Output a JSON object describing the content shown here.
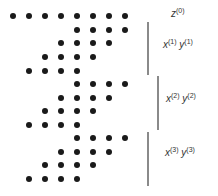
{
  "diagram": {
    "colors": {
      "dot": "#1a1a1a",
      "line": "#8a8a8a",
      "text": "#333333"
    },
    "grid": {
      "x0": 13,
      "dx": 16
    },
    "rows": [
      {
        "y": 16,
        "cols": [
          0,
          1,
          2,
          3,
          4,
          5,
          6,
          7
        ],
        "group": "z0"
      },
      {
        "y": 30,
        "cols": [
          4,
          5,
          6,
          7
        ],
        "group": "1"
      },
      {
        "y": 43,
        "cols": [
          3,
          4,
          5,
          6
        ],
        "group": "1"
      },
      {
        "y": 57,
        "cols": [
          2,
          3,
          4,
          5
        ],
        "group": "1"
      },
      {
        "y": 71,
        "cols": [
          1,
          2,
          3,
          4
        ],
        "group": "1"
      },
      {
        "y": 84,
        "cols": [
          4,
          5,
          6,
          7
        ],
        "group": "2"
      },
      {
        "y": 98,
        "cols": [
          3,
          4,
          5,
          6
        ],
        "group": "2"
      },
      {
        "y": 111,
        "cols": [
          2,
          3,
          4,
          5
        ],
        "group": "2"
      },
      {
        "y": 125,
        "cols": [
          1,
          2,
          3,
          4
        ],
        "group": "2"
      },
      {
        "y": 138,
        "cols": [
          4,
          5,
          6,
          7
        ],
        "group": "3"
      },
      {
        "y": 152,
        "cols": [
          3,
          4,
          5,
          6
        ],
        "group": "3"
      },
      {
        "y": 165,
        "cols": [
          2,
          3,
          4,
          5
        ],
        "group": "3"
      },
      {
        "y": 179,
        "cols": [
          1,
          2,
          3,
          4
        ],
        "group": "3"
      }
    ],
    "brackets": [
      {
        "x": 147,
        "y1": 22,
        "y2": 75
      },
      {
        "x": 157,
        "y1": 76,
        "y2": 130
      },
      {
        "x": 147,
        "y1": 132,
        "y2": 186
      }
    ],
    "labels": {
      "z0": {
        "var": "z",
        "sup": "(0)"
      },
      "g1": {
        "var1": "x",
        "sup1": "(1)",
        "var2": "y",
        "sup2": "(1)"
      },
      "g2": {
        "var1": "x",
        "sup1": "(2)",
        "var2": "y",
        "sup2": "(2)"
      },
      "g3": {
        "var1": "x",
        "sup1": "(3)",
        "var2": "y",
        "sup2": "(3)"
      }
    }
  }
}
